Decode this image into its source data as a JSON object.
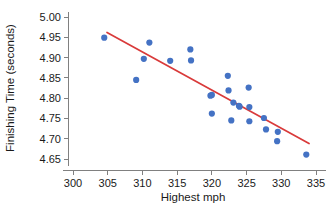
{
  "chart_data": {
    "type": "scatter",
    "title": "",
    "xlabel": "Highest mph",
    "ylabel": "Finishing Time (seconds)",
    "xlim": [
      298.5,
      336.5
    ],
    "ylim": [
      4.632,
      5.012
    ],
    "xticks": [
      300,
      305,
      310,
      315,
      320,
      325,
      330,
      335
    ],
    "xticklabels": [
      "300",
      "305",
      "310",
      "315",
      "320",
      "325",
      "330",
      "335"
    ],
    "yticks": [
      4.65,
      4.7,
      4.75,
      4.8,
      4.85,
      4.9,
      4.95,
      5.0
    ],
    "yticklabels": [
      "4.65",
      "4.70",
      "4.75",
      "4.80",
      "4.85",
      "4.90",
      "4.95",
      "5.00"
    ],
    "grid": false,
    "legend": false,
    "point_color": "#4472C4",
    "point_size": 3.1,
    "series": [
      {
        "name": "runs",
        "x": [
          304.5,
          309.1,
          310.2,
          311.0,
          314.0,
          316.9,
          317.0,
          319.8,
          320.0,
          320.0,
          322.3,
          322.4,
          322.8,
          323.1,
          323.9,
          324.0,
          325.3,
          325.4,
          325.4,
          327.5,
          327.8,
          329.4,
          329.5,
          333.6
        ],
        "y": [
          4.949,
          4.845,
          4.897,
          4.937,
          4.892,
          4.92,
          4.893,
          4.806,
          4.808,
          4.762,
          4.855,
          4.819,
          4.745,
          4.789,
          4.781,
          4.779,
          4.826,
          4.778,
          4.743,
          4.751,
          4.723,
          4.694,
          4.717,
          4.661
        ]
      }
    ],
    "fit_line": {
      "color": "#D93A3A",
      "width": 1.7,
      "x_start": 304.9,
      "y_start": 4.962,
      "x_end": 334.0,
      "y_end": 4.688
    }
  }
}
